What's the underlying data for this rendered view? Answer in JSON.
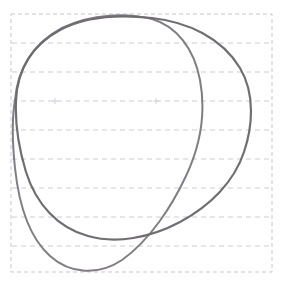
{
  "canvas": {
    "width": 282,
    "height": 281,
    "background_color": "#ffffff",
    "title": "Hand-drawn overlapping loops on dashed grid paper",
    "medium": "pencil sketch"
  },
  "grid": {
    "name": "dashed-grid-paper",
    "border": {
      "visible": true,
      "color": "#c9c3d2",
      "dash": "4 3",
      "stroke_width": 1,
      "x": 11,
      "y": 14,
      "width": 261,
      "height": 258,
      "label": "dashed page border"
    },
    "horizontal_lines": {
      "visible": true,
      "count": 8,
      "color": "#cfc9d6",
      "dash": "5 4",
      "stroke_width": 1,
      "spacing": 29,
      "y_positions": [
        43,
        72,
        101,
        130,
        159,
        188,
        217,
        246
      ]
    },
    "vertical_lines": {
      "visible": false,
      "count": 0,
      "y_positions": []
    },
    "tick_marks": {
      "visible": true,
      "color": "#d5cfda",
      "positions": [
        {
          "x": 55,
          "y": 101
        },
        {
          "x": 156,
          "y": 101
        }
      ]
    }
  },
  "strokes": {
    "color": "#5c5a60",
    "secondary_color": "#6e6b73",
    "stroke_width": 2.1,
    "linecap": "round",
    "linejoin": "round",
    "opacity": 0.88,
    "count": 2,
    "items": [
      {
        "name": "outer-loop",
        "description": "large rounded closed loop covering most of the page, flattened at top, bulging right and sweeping down to a low bottom",
        "stroke_width": 2.2,
        "path": "M 16 101 C 17 70 32 45 60 30 C 88 15 124 15 152 18 C 188 22 222 38 240 68 C 256 95 252 128 244 152 C 234 182 210 206 180 222 C 150 238 116 244 88 236 C 58 228 36 204 26 172 C 19 149 15 124 16 101 Z"
      },
      {
        "name": "inner-loop",
        "description": "second loop sharing the top arc, bulging right of center then sweeping far down-left to a deep bottom near the lower page edge",
        "stroke_width": 2.0,
        "path": "M 15 100 C 18 68 34 43 62 28 C 92 13 128 13 152 19 C 176 26 194 48 200 80 C 206 112 200 146 186 176 C 172 206 150 240 122 260 C 98 276 70 274 50 256 C 30 238 19 206 15 168 C 12 140 12 118 15 100 Z"
      }
    ]
  },
  "intersections": {
    "count": 2,
    "points": [
      {
        "name": "upper-left-crossing",
        "x": 15,
        "y": 100
      },
      {
        "name": "lower-right-crossing",
        "x": 177,
        "y": 197
      }
    ]
  },
  "extremes": {
    "topmost": {
      "x": 124,
      "y": 17
    },
    "leftmost": {
      "x": 13,
      "y": 140
    },
    "rightmost": {
      "x": 250,
      "y": 128
    },
    "bottommost": {
      "x": 110,
      "y": 272
    }
  }
}
